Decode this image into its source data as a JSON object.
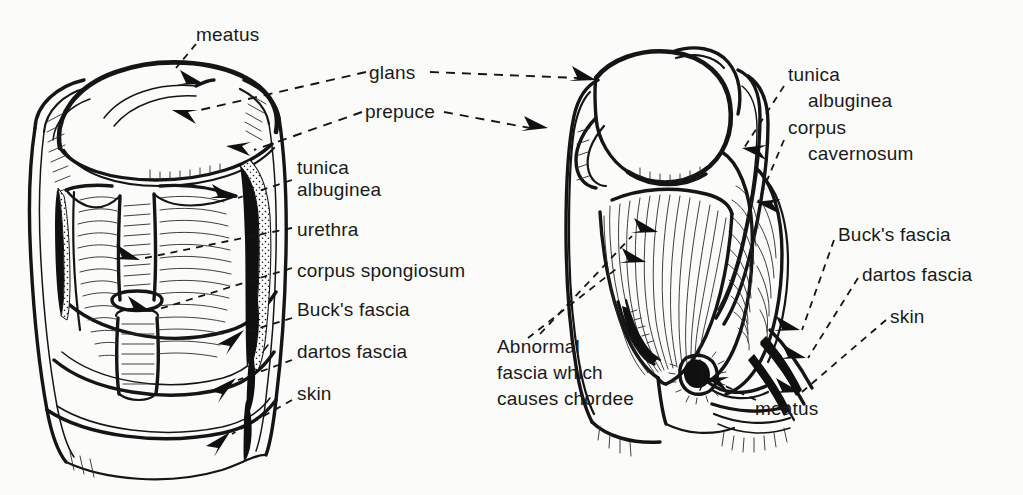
{
  "figure": {
    "background_color": "#fbfbf9",
    "ink_color": "#1a1a1a",
    "panels": [
      {
        "name": "left-panel",
        "description": "Normal penis, circumferential dissection showing concentric fascial layers"
      },
      {
        "name": "right-panel",
        "description": "Hypospadias with chordee, ventral view showing abnormal fascia and proximal meatus"
      }
    ],
    "labels": {
      "left_meatus": "meatus",
      "glans": "glans",
      "prepuce": "prepuce",
      "left_tunica_line1": "tunica",
      "left_tunica_line2": "albuginea",
      "left_urethra": "urethra",
      "left_corpus_spongiosum": "corpus spongiosum",
      "left_bucks_fascia": "Buck's fascia",
      "left_dartos_fascia": "dartos fascia",
      "left_skin": "skin",
      "right_tunica_line1": "tunica",
      "right_tunica_line2": "albuginea",
      "right_corpus_line1": "corpus",
      "right_corpus_line2": "cavernosum",
      "right_bucks_fascia": "Buck's fascia",
      "right_dartos_fascia": "dartos fascia",
      "right_skin": "skin",
      "abnormal_fascia": "Abnormal\nfascia which\ncauses chordee",
      "right_meatus": "meatus"
    }
  }
}
